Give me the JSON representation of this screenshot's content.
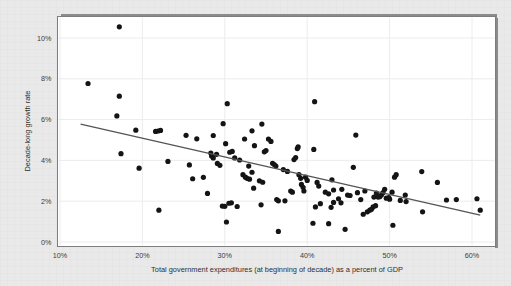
{
  "chart_data": {
    "type": "scatter",
    "title": "",
    "xlabel": "Total government expenditures (at beginning of decade) as a percent of GDP",
    "ylabel": "Decade-long growth rate",
    "xlim": [
      10,
      63
    ],
    "ylim": [
      0,
      11
    ],
    "xticks": [
      10,
      20,
      30,
      40,
      50,
      60
    ],
    "xticklabels": [
      "10%",
      "20%",
      "30%",
      "40%",
      "50%",
      "60%"
    ],
    "yticks": [
      0,
      2,
      4,
      6,
      8,
      10
    ],
    "yticklabels": [
      "0%",
      "2%",
      "4%",
      "6%",
      "8%",
      "10%"
    ],
    "grid": true,
    "legend": null,
    "marker_color": "#141414",
    "trendline_color": "#555555",
    "plot_bg_color": "#ffffff",
    "figure_bg_color": "#e9e9e9",
    "trendline": {
      "name": "linear fit",
      "x_start": 12.5,
      "y_start": 5.78,
      "x_end": 61.0,
      "y_end": 1.32
    },
    "series": [
      {
        "name": "Country decades",
        "points": [
          [
            17.2,
            10.55
          ],
          [
            13.4,
            7.77
          ],
          [
            17.2,
            7.15
          ],
          [
            16.9,
            6.18
          ],
          [
            30.3,
            6.78
          ],
          [
            40.9,
            6.88
          ],
          [
            17.4,
            4.33
          ],
          [
            19.2,
            5.48
          ],
          [
            21.6,
            5.42
          ],
          [
            21.9,
            5.44
          ],
          [
            22.2,
            5.47
          ],
          [
            25.3,
            5.23
          ],
          [
            26.6,
            5.06
          ],
          [
            28.6,
            5.22
          ],
          [
            29.8,
            5.8
          ],
          [
            30.1,
            4.82
          ],
          [
            32.4,
            5.05
          ],
          [
            33.3,
            5.45
          ],
          [
            34.5,
            5.78
          ],
          [
            33.6,
            4.72
          ],
          [
            35.3,
            5.05
          ],
          [
            35.6,
            4.93
          ],
          [
            45.9,
            5.24
          ],
          [
            19.6,
            3.62
          ],
          [
            23.1,
            3.95
          ],
          [
            25.7,
            3.78
          ],
          [
            26.1,
            3.1
          ],
          [
            27.4,
            3.17
          ],
          [
            28.3,
            4.36
          ],
          [
            28.4,
            4.22
          ],
          [
            28.6,
            4.12
          ],
          [
            29.1,
            3.85
          ],
          [
            29.4,
            3.76
          ],
          [
            30.6,
            4.4
          ],
          [
            31.2,
            4.12
          ],
          [
            31.8,
            4.02
          ],
          [
            32.2,
            3.3
          ],
          [
            32.5,
            3.18
          ],
          [
            32.7,
            3.12
          ],
          [
            33.0,
            3.08
          ],
          [
            33.3,
            3.42
          ],
          [
            33.5,
            2.64
          ],
          [
            34.2,
            3.0
          ],
          [
            34.6,
            2.93
          ],
          [
            35.8,
            3.86
          ],
          [
            36.2,
            3.72
          ],
          [
            37.1,
            3.55
          ],
          [
            37.6,
            3.46
          ],
          [
            38.4,
            4.04
          ],
          [
            38.6,
            4.14
          ],
          [
            38.8,
            4.58
          ],
          [
            38.9,
            4.66
          ],
          [
            39.0,
            3.3
          ],
          [
            39.2,
            3.12
          ],
          [
            39.3,
            2.82
          ],
          [
            39.5,
            2.68
          ],
          [
            40.8,
            4.54
          ],
          [
            41.2,
            2.92
          ],
          [
            41.4,
            2.74
          ],
          [
            42.2,
            2.44
          ],
          [
            42.6,
            2.36
          ],
          [
            43.0,
            3.05
          ],
          [
            43.2,
            2.55
          ],
          [
            43.8,
            2.12
          ],
          [
            44.1,
            1.92
          ],
          [
            45.6,
            3.66
          ],
          [
            46.1,
            2.42
          ],
          [
            47.0,
            2.5
          ],
          [
            47.3,
            1.48
          ],
          [
            47.6,
            1.56
          ],
          [
            47.8,
            1.6
          ],
          [
            48.1,
            2.2
          ],
          [
            48.4,
            2.4
          ],
          [
            48.6,
            2.2
          ],
          [
            48.8,
            2.22
          ],
          [
            49.0,
            2.3
          ],
          [
            49.2,
            2.42
          ],
          [
            49.6,
            2.15
          ],
          [
            49.9,
            2.18
          ],
          [
            50.3,
            2.44
          ],
          [
            50.6,
            3.18
          ],
          [
            50.8,
            3.3
          ],
          [
            51.3,
            2.04
          ],
          [
            52.0,
            1.98
          ],
          [
            53.9,
            3.45
          ],
          [
            54.0,
            1.48
          ],
          [
            55.8,
            2.92
          ],
          [
            56.9,
            2.06
          ],
          [
            58.1,
            2.08
          ],
          [
            60.6,
            2.12
          ],
          [
            61.0,
            1.56
          ],
          [
            22.0,
            1.56
          ],
          [
            29.7,
            1.76
          ],
          [
            30.0,
            1.75
          ],
          [
            30.5,
            1.9
          ],
          [
            30.8,
            1.92
          ],
          [
            31.5,
            1.74
          ],
          [
            34.4,
            1.82
          ],
          [
            36.3,
            2.08
          ],
          [
            36.5,
            2.02
          ],
          [
            30.2,
            0.98
          ],
          [
            36.5,
            0.52
          ],
          [
            40.7,
            0.92
          ],
          [
            42.6,
            0.9
          ],
          [
            44.6,
            0.62
          ],
          [
            50.4,
            0.82
          ],
          [
            27.9,
            2.38
          ],
          [
            38.0,
            2.5
          ],
          [
            38.2,
            2.44
          ],
          [
            39.6,
            2.5
          ],
          [
            41.0,
            1.72
          ],
          [
            41.6,
            1.88
          ],
          [
            43.2,
            1.94
          ],
          [
            44.9,
            2.3
          ],
          [
            45.2,
            2.28
          ],
          [
            46.5,
            2.08
          ],
          [
            46.8,
            1.36
          ],
          [
            48.0,
            1.72
          ],
          [
            48.3,
            1.78
          ],
          [
            51.9,
            2.3
          ],
          [
            39.8,
            3.18
          ],
          [
            40.0,
            3.02
          ],
          [
            37.3,
            2.02
          ],
          [
            34.8,
            4.42
          ],
          [
            35.0,
            4.48
          ],
          [
            36.0,
            3.8
          ],
          [
            32.9,
            3.72
          ],
          [
            30.9,
            4.44
          ],
          [
            29.0,
            4.3
          ],
          [
            44.2,
            2.58
          ],
          [
            42.9,
            1.7
          ],
          [
            49.4,
            2.58
          ],
          [
            50.0,
            2.1
          ]
        ]
      }
    ]
  }
}
